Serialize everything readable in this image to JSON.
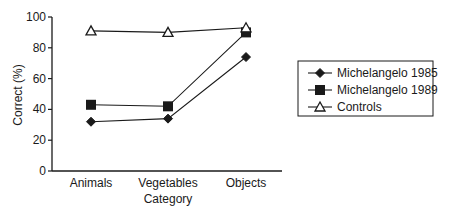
{
  "chart_data": {
    "type": "line",
    "title": "",
    "xlabel": "Category",
    "ylabel": "Correct (%)",
    "categories": [
      "Animals",
      "Vegetables",
      "Objects"
    ],
    "ylim": [
      0,
      100
    ],
    "yticks": [
      0,
      20,
      40,
      60,
      80,
      100
    ],
    "grid": false,
    "legend_position": "right",
    "series": [
      {
        "name": "Michelangelo 1985",
        "marker": "filled-diamond",
        "values": [
          32,
          34,
          74
        ]
      },
      {
        "name": "Michelangelo 1989",
        "marker": "filled-square",
        "values": [
          43,
          42,
          90
        ]
      },
      {
        "name": "Controls",
        "marker": "open-triangle",
        "values": [
          91,
          90,
          93
        ]
      }
    ]
  },
  "colors": {
    "line": "#1a1a1a",
    "background": "#ffffff"
  }
}
